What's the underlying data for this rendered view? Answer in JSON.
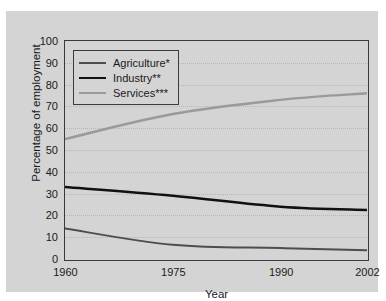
{
  "chart_data": {
    "type": "line",
    "title": "",
    "xlabel": "Year",
    "ylabel": "Percentage of employment",
    "xlim": [
      1960,
      2002
    ],
    "ylim": [
      0,
      100
    ],
    "grid": true,
    "legend_position": "upper left",
    "x": [
      1960,
      1975,
      1990,
      2002
    ],
    "xtick_labels": [
      "1960",
      "1975",
      "1990",
      "2002"
    ],
    "xtick_minor_count_between": 1,
    "ytick_labels": [
      "0",
      "10",
      "20",
      "30",
      "40",
      "50",
      "60",
      "70",
      "80",
      "90",
      "100"
    ],
    "ytick_values": [
      0,
      10,
      20,
      30,
      40,
      50,
      60,
      70,
      80,
      90,
      100
    ],
    "series": [
      {
        "name": "Agriculture*",
        "color": "#4d4d4d",
        "width": 2.0,
        "values": [
          14,
          6.5,
          5,
          4
        ]
      },
      {
        "name": "Industry**",
        "color": "#111111",
        "width": 2.6,
        "values": [
          33,
          29,
          24,
          22.5
        ]
      },
      {
        "name": "Services***",
        "color": "#9a9a9a",
        "width": 2.4,
        "values": [
          55,
          66.5,
          73,
          76
        ]
      }
    ]
  },
  "legend": {
    "items": [
      {
        "label": "Agriculture*"
      },
      {
        "label": "Industry**"
      },
      {
        "label": "Services***"
      }
    ]
  },
  "axes": {
    "y_title": "Percentage of employment",
    "x_title": "Year"
  },
  "colors": {
    "background": "#d4d4d4",
    "axis": "#3a3a3a",
    "grid": "#b6b6b6",
    "agriculture": "#4d4d4d",
    "industry": "#111111",
    "services": "#9a9a9a"
  }
}
